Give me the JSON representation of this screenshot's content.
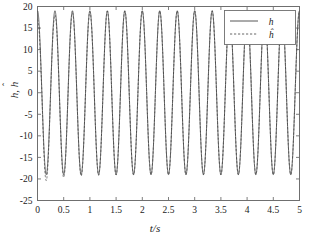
{
  "chart_data": {
    "type": "line",
    "title": "",
    "xlabel": "t/s",
    "ylabel": "h, ĥ",
    "xlim": [
      0,
      5
    ],
    "ylim": [
      -25,
      20
    ],
    "xticks": [
      0,
      0.5,
      1,
      1.5,
      2,
      2.5,
      3,
      3.5,
      4,
      4.5,
      5
    ],
    "xticklabels": [
      "0",
      "0.5",
      "1",
      "1.5",
      "2",
      "2.5",
      "3",
      "3.5",
      "4",
      "4.5",
      "5"
    ],
    "yticks": [
      -25,
      -20,
      -15,
      -10,
      -5,
      0,
      5,
      10,
      15,
      20
    ],
    "yticklabels": [
      "-25",
      "-20",
      "-15",
      "-10",
      "-5",
      "0",
      "5",
      "10",
      "15",
      "20"
    ],
    "grid": false,
    "legend_position": "upper right",
    "series": [
      {
        "name": "h",
        "label": "h",
        "style": "solid",
        "color": "#444444",
        "waveform": {
          "kind": "sine",
          "amplitude": 19.0,
          "frequency_hz": 3.0,
          "phase_rad": 1.5708,
          "offset": 0.0
        }
      },
      {
        "name": "h_hat",
        "label": "ĥ",
        "style": "dashed",
        "color": "#555555",
        "waveform": {
          "kind": "sine",
          "amplitude": 19.0,
          "frequency_hz": 3.0,
          "phase_rad": 1.5708,
          "offset": 0.0,
          "transient_amplitude": 2.0,
          "transient_decay": 2.2,
          "transient_note": "estimate overshoots slightly below troughs for first ~1.2 s then converges"
        }
      }
    ],
    "axis_ranges_note": "peaks reach about 19, troughs about -19; estimate dips to about -20.5 during early transient",
    "cycles_visible": 15
  },
  "legend": {
    "entries": [
      {
        "label": "h",
        "style": "solid"
      },
      {
        "label": "ĥ",
        "style": "dashed"
      }
    ]
  },
  "axes": {
    "x_title": "t/s",
    "y_title": "h, ĥ",
    "y_title_base": "h",
    "y_title_hat_base": "h",
    "y_title_sep": ", "
  }
}
